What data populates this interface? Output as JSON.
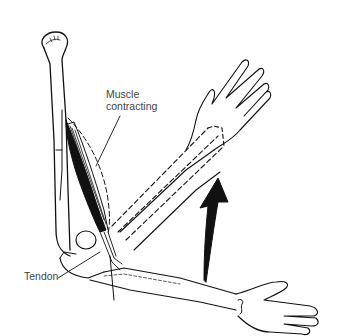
{
  "diagram": {
    "labels": {
      "muscle_line1": "Muscle",
      "muscle_line2": "contracting",
      "tendon": "Tendon"
    },
    "elements": [
      "humerus-bone",
      "biceps-muscle",
      "tendon",
      "forearm-lowered",
      "hand-lowered",
      "forearm-raised-outline",
      "hand-raised",
      "motion-arrow"
    ],
    "colors": {
      "line": "#111111",
      "label": "#444444",
      "background": "#ffffff"
    }
  }
}
